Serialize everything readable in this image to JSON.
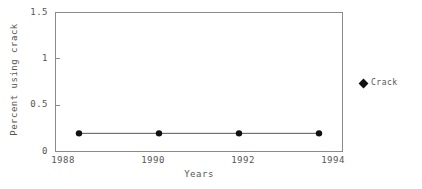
{
  "chart_data": {
    "type": "line",
    "title": "",
    "xlabel": "Years",
    "ylabel": "Percent using crack",
    "x": [
      1988,
      1990,
      1992,
      1994
    ],
    "xticklabels": [
      "1988",
      "1990",
      "1992",
      "1994"
    ],
    "yticklabels": [
      "0",
      "0.5",
      "1",
      "1.5"
    ],
    "yticks": [
      0,
      0.5,
      1,
      1.5
    ],
    "ylim": [
      0,
      1.5
    ],
    "xlim": [
      1987.4,
      1994.6
    ],
    "grid": false,
    "legend_position": "right",
    "series": [
      {
        "name": "Crack",
        "values": [
          0.2,
          0.2,
          0.2,
          0.2
        ],
        "color": "#111111",
        "marker": "circle",
        "line_color": "#555555"
      }
    ]
  },
  "legend": {
    "entries": [
      {
        "label": "Crack",
        "marker": "diamond",
        "color": "#111111"
      }
    ]
  },
  "axes": {
    "y_ticks": [
      {
        "label": "1.5",
        "value": 1.5
      },
      {
        "label": "1",
        "value": 1.0
      },
      {
        "label": "0.5",
        "value": 0.5
      },
      {
        "label": "0",
        "value": 0.0
      }
    ],
    "x_ticks": [
      {
        "label": "1988",
        "value": 1988
      },
      {
        "label": "1990",
        "value": 1990
      },
      {
        "label": "1992",
        "value": 1992
      },
      {
        "label": "1994",
        "value": 1994
      }
    ],
    "x_title": "Years",
    "y_title": "Percent using crack",
    "frame_color": "#8a8a8a"
  }
}
